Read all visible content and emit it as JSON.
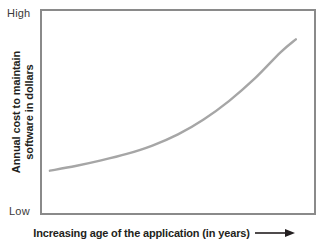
{
  "figure": {
    "background_color": "#ffffff",
    "border_color": "#8a8a8a",
    "curve_color": "#a6a6a6",
    "text_color": "#231f20"
  },
  "y_axis": {
    "title_line_1": "Annual cost to maintain",
    "title_line_2": "software in dollars",
    "max_label": "High",
    "min_label": "Low"
  },
  "x_axis": {
    "title": "Increasing age of the application (in years)",
    "arrow_icon": "right-arrow-icon"
  },
  "chart_data": {
    "type": "line",
    "title": "",
    "xlabel": "Increasing age of the application (in years)",
    "ylabel": "Annual cost to maintain software in dollars",
    "grid": false,
    "legend": null,
    "xlim": [
      0,
      10
    ],
    "ylim": [
      0,
      100
    ],
    "x_tick_labels": [],
    "y_tick_labels": [
      "Low",
      "High"
    ],
    "series": [
      {
        "name": "Annual maintenance cost",
        "color": "#a6a6a6",
        "x": [
          0.0,
          1.0,
          2.0,
          3.0,
          4.0,
          5.0,
          6.0,
          7.0,
          8.0,
          9.0,
          9.6
        ],
        "values": [
          18.5,
          21.0,
          24.0,
          27.5,
          32.0,
          38.0,
          46.0,
          56.0,
          68.0,
          82.0,
          89.0
        ]
      }
    ],
    "annotations": [
      "Curve rises slowly at first then grows exponentially",
      "Arrow at end of x-axis label indicates increasing direction"
    ]
  }
}
